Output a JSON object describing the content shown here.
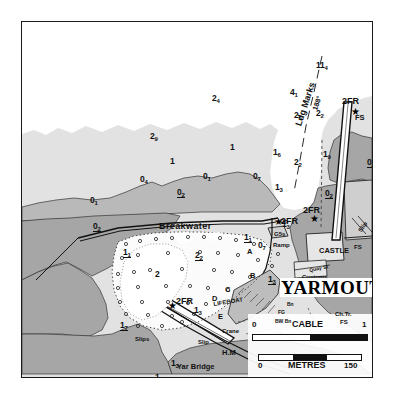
{
  "chart": {
    "title": "YARMOUTH",
    "type": "nautical-harbour-chart",
    "place_name": "YARMOUTH"
  },
  "scale_bars": [
    {
      "label": "CABLE",
      "min": "0",
      "max": "1"
    },
    {
      "label": "METRES",
      "min": "0",
      "max": "150"
    }
  ],
  "leading_line": {
    "label": "Ldg Marks",
    "bearing": "188°"
  },
  "soundings": [
    {
      "v": "11",
      "sub": "4",
      "drying": false,
      "x": 294,
      "y": 39
    },
    {
      "v": "4",
      "sub": "1",
      "drying": false,
      "x": 268,
      "y": 66
    },
    {
      "v": "2",
      "sub": "4",
      "drying": false,
      "x": 190,
      "y": 72
    },
    {
      "v": "2",
      "sub": "5",
      "drying": false,
      "x": 272,
      "y": 89
    },
    {
      "v": "2",
      "sub": "2",
      "drying": false,
      "x": 294,
      "y": 87
    },
    {
      "v": "2",
      "sub": "9",
      "drying": false,
      "x": 128,
      "y": 110
    },
    {
      "v": "1",
      "sub": "",
      "drying": false,
      "x": 208,
      "y": 121
    },
    {
      "v": "1",
      "sub": "",
      "drying": false,
      "x": 148,
      "y": 135
    },
    {
      "v": "1",
      "sub": "6",
      "drying": false,
      "x": 251,
      "y": 126
    },
    {
      "v": "2",
      "sub": "2",
      "drying": false,
      "x": 272,
      "y": 136
    },
    {
      "v": "1",
      "sub": "9",
      "drying": false,
      "x": 301,
      "y": 128
    },
    {
      "v": "0",
      "sub": "2",
      "drying": true,
      "x": 345,
      "y": 136
    },
    {
      "v": "0",
      "sub": "4",
      "drying": false,
      "x": 118,
      "y": 153
    },
    {
      "v": "0",
      "sub": "1",
      "drying": false,
      "x": 181,
      "y": 150
    },
    {
      "v": "0",
      "sub": "7",
      "drying": false,
      "x": 231,
      "y": 150
    },
    {
      "v": "1",
      "sub": "3",
      "drying": false,
      "x": 253,
      "y": 161
    },
    {
      "v": "0",
      "sub": "2",
      "drying": true,
      "x": 155,
      "y": 166
    },
    {
      "v": "0",
      "sub": "2",
      "drying": true,
      "x": 303,
      "y": 167
    },
    {
      "v": "0",
      "sub": "1",
      "drying": false,
      "x": 68,
      "y": 174
    },
    {
      "v": "0",
      "sub": "2",
      "drying": true,
      "x": 71,
      "y": 200
    },
    {
      "v": "1",
      "sub": "3",
      "drying": false,
      "x": 260,
      "y": 198
    },
    {
      "v": "1",
      "sub": "1",
      "drying": true,
      "x": 222,
      "y": 211
    },
    {
      "v": "0",
      "sub": "7",
      "drying": false,
      "x": 236,
      "y": 219
    },
    {
      "v": "1",
      "sub": "1",
      "drying": true,
      "x": 101,
      "y": 226
    },
    {
      "v": "2",
      "sub": "2",
      "drying": true,
      "x": 173,
      "y": 229
    },
    {
      "v": "2",
      "sub": "",
      "drying": false,
      "x": 133,
      "y": 248
    },
    {
      "v": "1",
      "sub": "3",
      "drying": true,
      "x": 246,
      "y": 253
    },
    {
      "v": "1",
      "sub": "3",
      "drying": false,
      "x": 172,
      "y": 284
    },
    {
      "v": "1",
      "sub": "7",
      "drying": true,
      "x": 98,
      "y": 299
    },
    {
      "v": "1",
      "sub": "3",
      "drying": false,
      "x": 149,
      "y": 337
    },
    {
      "v": "1",
      "sub": "4",
      "drying": true,
      "x": 133,
      "y": 351
    }
  ],
  "features": [
    {
      "name": "Breakwater",
      "label": "Breakwater",
      "x": 137,
      "y": 200,
      "cls": "rot-breakwater"
    },
    {
      "name": "castle",
      "label": "CASTLE",
      "x": 297,
      "y": 225,
      "cls": "name-md"
    },
    {
      "name": "customs",
      "label": "Customs",
      "x": 280,
      "y": 252,
      "cls": "name-sm"
    },
    {
      "name": "quay-street",
      "label": "Quay St",
      "x": 288,
      "y": 246,
      "cls": "rot-quay"
    },
    {
      "name": "ramp",
      "label": "Ramp",
      "x": 251,
      "y": 220,
      "cls": "name-sm"
    },
    {
      "name": "rsyc",
      "label": "RSYC",
      "x": 350,
      "y": 222,
      "cls": "name-sm"
    },
    {
      "name": "flagstaff-rsyc",
      "label": "FS",
      "x": 332,
      "y": 222,
      "cls": "name-sm"
    },
    {
      "name": "slip-rsyc",
      "label": "Slip",
      "x": 340,
      "y": 205,
      "cls": "rot-slip"
    },
    {
      "name": "lifeboat",
      "label": "LIFEBOAT",
      "x": 192,
      "y": 279,
      "cls": "rot-lifeboat"
    },
    {
      "name": "crane",
      "label": "Crane",
      "x": 200,
      "y": 306,
      "cls": "name-sm"
    },
    {
      "name": "slip-inner",
      "label": "Slip",
      "x": 176,
      "y": 317,
      "cls": "name-sm"
    },
    {
      "name": "slips-west",
      "label": "Slips",
      "x": 113,
      "y": 314,
      "cls": "name-sm"
    },
    {
      "name": "harbour-master",
      "label": "H.M",
      "x": 200,
      "y": 327,
      "cls": "name-md"
    },
    {
      "name": "yar-bridge",
      "label": "Yar Bridge",
      "x": 155,
      "y": 341,
      "cls": "name-md"
    },
    {
      "name": "church-tower",
      "label": "Ch.Tr.",
      "x": 313,
      "y": 289,
      "cls": "name-sm"
    },
    {
      "name": "flagstaff-town",
      "label": "FS",
      "x": 318,
      "y": 297,
      "cls": "name-sm"
    },
    {
      "name": "dolphin",
      "label": "Dn",
      "x": 258,
      "y": 196,
      "cls": "name-sm"
    },
    {
      "name": "light-g5s",
      "label": "G5s",
      "x": 252,
      "y": 209,
      "cls": "name-sm"
    },
    {
      "name": "flagstaff-pier",
      "label": "FS",
      "x": 333,
      "y": 92,
      "cls": "name-md"
    },
    {
      "name": "light-fg-1",
      "label": "FG",
      "x": 262,
      "y": 270,
      "cls": "name-xs"
    },
    {
      "name": "beacon-1",
      "label": "Bn",
      "x": 265,
      "y": 280,
      "cls": "name-xs"
    },
    {
      "name": "light-fg-2",
      "label": "FG",
      "x": 256,
      "y": 288,
      "cls": "name-xs"
    },
    {
      "name": "beacon-bw",
      "label": "BW Bn",
      "x": 253,
      "y": 297,
      "cls": "name-xs"
    }
  ],
  "lights": [
    {
      "name": "light-2fr-pier",
      "label": "2FR",
      "x": 320,
      "y": 75,
      "sx": 329,
      "sy": 85
    },
    {
      "name": "light-2fr-castle",
      "label": "2FR",
      "x": 281,
      "y": 184,
      "sx": 288,
      "sy": 192
    },
    {
      "name": "light-2fr-bw",
      "label": "2FR",
      "x": 259,
      "y": 195,
      "sx": 252,
      "sy": 195
    },
    {
      "name": "light-2fr-inner",
      "label": "2FR",
      "x": 154,
      "y": 275,
      "sx": 146,
      "sy": 279
    }
  ],
  "mooring_trots": [
    {
      "label": "A",
      "x": 225,
      "y": 226
    },
    {
      "label": "B",
      "x": 228,
      "y": 250
    },
    {
      "label": "C",
      "x": 203,
      "y": 264
    },
    {
      "label": "D",
      "x": 190,
      "y": 273
    },
    {
      "label": "E",
      "x": 196,
      "y": 291
    }
  ],
  "colors": {
    "deep_water": "#ffffff",
    "shallow_water": "#e2e2e2",
    "drying_area": "#b9b9b9",
    "land": "#a6a6a6",
    "ink": "#111111",
    "harbour_white": "#fbfbfb"
  }
}
